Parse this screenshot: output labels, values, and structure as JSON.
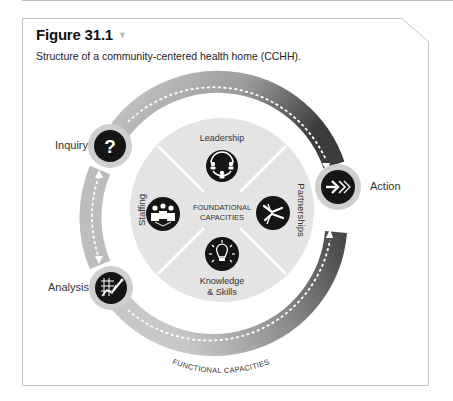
{
  "figure": {
    "number": "Figure 31.1",
    "toggle_icon": "triangle-down-icon",
    "caption": "Structure of a community-centered health home (CCHH)."
  },
  "diagram": {
    "inner_center_label": [
      "FOUNDATIONAL",
      "CAPACITIES"
    ],
    "outer_ring_label": "FUNCTIONAL CAPACITIES",
    "foundational": [
      {
        "label": "Leadership",
        "icon": "leadership-cycle-icon"
      },
      {
        "label": "Partnerships",
        "icon": "handshake-icon"
      },
      {
        "label": "Knowledge",
        "label2": "& Skills",
        "icon": "lightbulb-icon"
      },
      {
        "label": "Staffing",
        "icon": "people-group-icon"
      }
    ],
    "functional": [
      {
        "label": "Inquiry",
        "icon": "question-mark-icon"
      },
      {
        "label": "Action",
        "icon": "forward-arrows-icon"
      },
      {
        "label": "Analysis",
        "icon": "chart-pencil-icon"
      }
    ],
    "colors": {
      "ring_light": "#bdbdbd",
      "ring_dark": "#4a4a4a",
      "disc": "#e4e4e4",
      "icon_bg": "#151515",
      "node_halo": "#cfcfcf"
    }
  }
}
